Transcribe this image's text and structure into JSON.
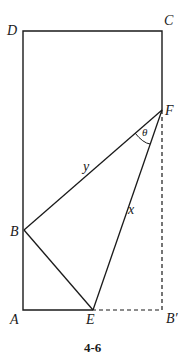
{
  "figure": {
    "caption": "4-6",
    "points": {
      "D": "D",
      "C": "C",
      "F": "F",
      "B": "B",
      "A": "A",
      "E": "E",
      "B_prime": "B′"
    },
    "segment_labels": {
      "y": "y",
      "x": "x",
      "theta": "θ"
    },
    "colors": {
      "line": "#1a1a1a",
      "background": "#ffffff"
    }
  }
}
